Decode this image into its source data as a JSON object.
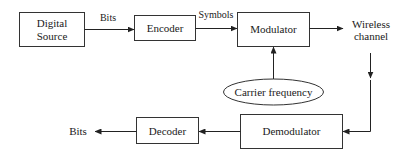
{
  "diagram": {
    "type": "block-diagram",
    "title": "",
    "nodes": {
      "digital_source": {
        "line1": "Digital",
        "line2": "Source",
        "shape": "rectangle"
      },
      "encoder": {
        "label": "Encoder",
        "shape": "rectangle"
      },
      "modulator": {
        "label": "Modulator",
        "shape": "rectangle"
      },
      "wireless_channel": {
        "line1": "Wireless",
        "line2": "channel",
        "shape": "text"
      },
      "carrier_frequency": {
        "label": "Carrier frequency",
        "shape": "ellipse"
      },
      "demodulator": {
        "label": "Demodulator",
        "shape": "rectangle"
      },
      "decoder": {
        "label": "Decoder",
        "shape": "rectangle"
      },
      "bits_out": {
        "label": "Bits",
        "shape": "text"
      }
    },
    "edge_labels": {
      "source_to_encoder": "Bits",
      "encoder_to_modulator": "Symbols"
    },
    "edges": [
      {
        "from": "Digital Source",
        "to": "Encoder",
        "label": "Bits"
      },
      {
        "from": "Encoder",
        "to": "Modulator",
        "label": "Symbols"
      },
      {
        "from": "Modulator",
        "to": "Wireless channel",
        "label": ""
      },
      {
        "from": "Carrier frequency",
        "to": "Modulator",
        "label": ""
      },
      {
        "from": "Wireless channel",
        "to": "Demodulator",
        "label": ""
      },
      {
        "from": "Demodulator",
        "to": "Decoder",
        "label": ""
      },
      {
        "from": "Decoder",
        "to": "Bits",
        "label": ""
      }
    ],
    "colors": {
      "stroke": "#333333",
      "text": "#1a1a1a",
      "background": "#ffffff"
    }
  }
}
